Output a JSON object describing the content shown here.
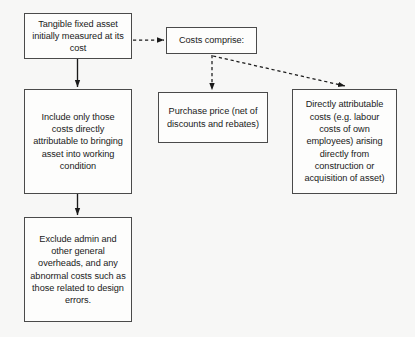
{
  "diagram": {
    "type": "flowchart",
    "background_color": "#f7f7f6",
    "box_fill_color": "#fdfdfc",
    "box_border_color": "#4a4a4a",
    "text_color": "#1a1a1a",
    "nodes": [
      {
        "id": "tangible-asset",
        "label": "Tangible fixed asset initially measured at its cost",
        "column": "left",
        "order": 1
      },
      {
        "id": "costs-comprise",
        "label": "Costs comprise:",
        "column": "middle",
        "order": 1
      },
      {
        "id": "include-costs",
        "label": "Include only those costs directly attributable to bringing asset into working condition",
        "column": "left",
        "order": 2
      },
      {
        "id": "exclude-costs",
        "label": "Exclude admin and other general overheads, and any abnormal costs such as those related to design errors.",
        "column": "left",
        "order": 3
      },
      {
        "id": "purchase-price",
        "label": "Purchase price (net of discounts and rebates)",
        "column": "middle",
        "order": 2
      },
      {
        "id": "directly-attributable",
        "label": "Directly attributable costs (e.g. labour costs of own employees) arising directly from construction or acquisition of asset)",
        "column": "right",
        "order": 2
      }
    ],
    "edges": [
      {
        "id": "tangible-to-costs",
        "from": "tangible-asset",
        "to": "costs-comprise",
        "style": "dashed",
        "arrow": true
      },
      {
        "id": "tangible-to-include",
        "from": "tangible-asset",
        "to": "include-costs",
        "style": "solid",
        "arrow": true
      },
      {
        "id": "include-to-exclude",
        "from": "include-costs",
        "to": "exclude-costs",
        "style": "solid",
        "arrow": true
      },
      {
        "id": "costs-to-purchase",
        "from": "costs-comprise",
        "to": "purchase-price",
        "style": "dashed",
        "arrow": true
      },
      {
        "id": "costs-to-directly",
        "from": "costs-comprise",
        "to": "directly-attributable",
        "style": "dashed",
        "arrow": true
      }
    ]
  }
}
